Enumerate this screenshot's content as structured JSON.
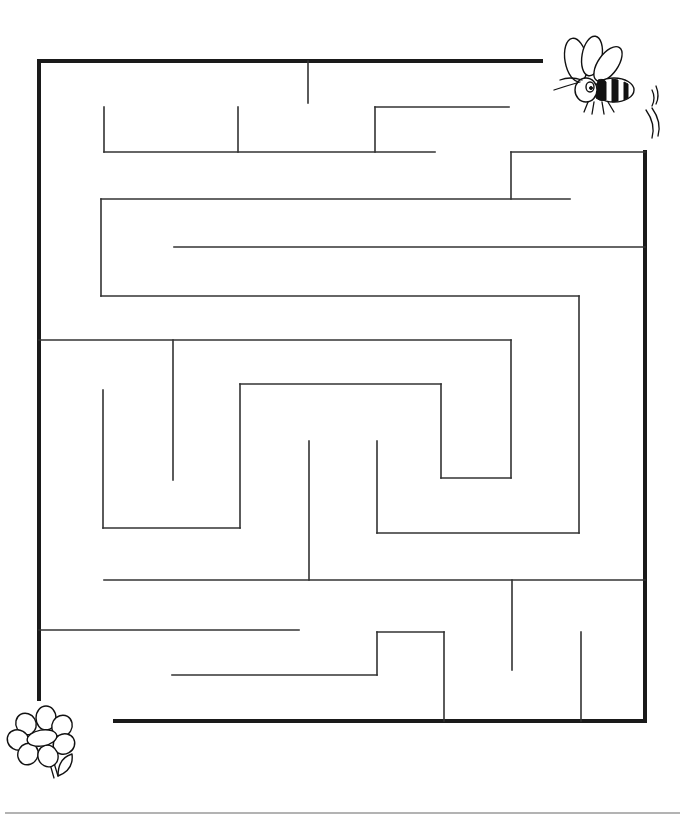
{
  "puzzle": {
    "type": "maze",
    "start": {
      "label": "bee",
      "icon": "bee-icon",
      "position": "top-right"
    },
    "goal": {
      "label": "flower",
      "icon": "flower-icon",
      "position": "bottom-left"
    },
    "colors": {
      "wall": "#333333",
      "border": "#1a1a1a",
      "background": "#ffffff",
      "rule": "#9a9a9a"
    },
    "borders": [
      [
        39,
        61,
        541,
        61
      ],
      [
        39,
        61,
        39,
        699
      ],
      [
        645,
        152,
        645,
        721
      ],
      [
        115,
        721,
        645,
        721
      ]
    ],
    "walls": [
      [
        308,
        61,
        308,
        103
      ],
      [
        104,
        107,
        104,
        152
      ],
      [
        238,
        107,
        238,
        152
      ],
      [
        104,
        152,
        435,
        152
      ],
      [
        375,
        107,
        375,
        152
      ],
      [
        375,
        107,
        509,
        107
      ],
      [
        511,
        152,
        645,
        152
      ],
      [
        511,
        152,
        511,
        199
      ],
      [
        101,
        199,
        570,
        199
      ],
      [
        101,
        199,
        101,
        296
      ],
      [
        174,
        247,
        645,
        247
      ],
      [
        101,
        296,
        579,
        296
      ],
      [
        579,
        296,
        579,
        533
      ],
      [
        39,
        340,
        511,
        340
      ],
      [
        511,
        340,
        511,
        478
      ],
      [
        173,
        340,
        173,
        480
      ],
      [
        103,
        390,
        103,
        528
      ],
      [
        103,
        528,
        240,
        528
      ],
      [
        240,
        384,
        240,
        528
      ],
      [
        240,
        384,
        441,
        384
      ],
      [
        441,
        384,
        441,
        478
      ],
      [
        441,
        478,
        511,
        478
      ],
      [
        309,
        441,
        309,
        580
      ],
      [
        377,
        441,
        377,
        533
      ],
      [
        377,
        533,
        579,
        533
      ],
      [
        104,
        580,
        645,
        580
      ],
      [
        39,
        630,
        299,
        630
      ],
      [
        172,
        675,
        377,
        675
      ],
      [
        377,
        632,
        377,
        675
      ],
      [
        377,
        632,
        444,
        632
      ],
      [
        444,
        632,
        444,
        721
      ],
      [
        512,
        580,
        512,
        670
      ],
      [
        581,
        632,
        581,
        721
      ]
    ],
    "footer_rule": [
      5,
      813,
      680,
      813
    ]
  }
}
